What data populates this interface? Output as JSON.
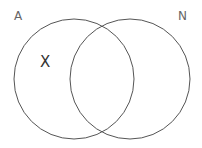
{
  "diagram": {
    "type": "venn",
    "sets": [
      {
        "label": "A",
        "cx": 74,
        "cy": 79,
        "r": 60
      },
      {
        "label": "N",
        "cx": 130,
        "cy": 79,
        "r": 60
      }
    ],
    "marker": {
      "text": "X",
      "region": "A only"
    },
    "colors": {
      "stroke": "#555555",
      "label": "#666666",
      "marker": "#333333",
      "background": "#ffffff"
    }
  }
}
